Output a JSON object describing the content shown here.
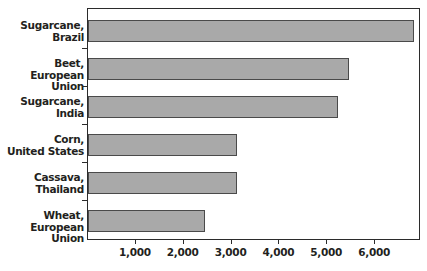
{
  "chart_data": {
    "type": "bar",
    "orientation": "horizontal",
    "title": "",
    "subtitle": "",
    "xlabel": "",
    "ylabel": "",
    "categories": [
      "Sugarcane,\nBrazil",
      "Beet,\nEuropean Union",
      "Sugarcane,\nIndia",
      "Corn,\nUnited States",
      "Cassava,\nThailand",
      "Wheat,\nEuropean Union"
    ],
    "values": [
      6810,
      5450,
      5220,
      3110,
      3110,
      2440
    ],
    "xlim": [
      0,
      6960
    ],
    "ylim": [
      0,
      6
    ],
    "xticks": [
      1000,
      2000,
      3000,
      4000,
      5000,
      6000
    ],
    "xticklabels": [
      "1,000",
      "2,000",
      "3,000",
      "4,000",
      "5,000",
      "6,000"
    ],
    "grid": false,
    "legend": false,
    "legend_position": "none",
    "bar_fill_color": "#a9a9a9",
    "bar_edge_color": "#4a4a4a",
    "axis_color": "#2b2b2b",
    "background_color": "#ffffff",
    "text_color": "#231f20"
  },
  "axis": {
    "tick_labels": [
      "1,000",
      "2,000",
      "3,000",
      "4,000",
      "5,000",
      "6,000"
    ]
  },
  "categories": {
    "items": [
      {
        "label": "Sugarcane,\nBrazil",
        "value": 6810
      },
      {
        "label": "Beet,\nEuropean Union",
        "value": 5450
      },
      {
        "label": "Sugarcane,\nIndia",
        "value": 5220
      },
      {
        "label": "Corn,\nUnited States",
        "value": 3110
      },
      {
        "label": "Cassava,\nThailand",
        "value": 3110
      },
      {
        "label": "Wheat,\nEuropean Union",
        "value": 2440
      }
    ]
  }
}
